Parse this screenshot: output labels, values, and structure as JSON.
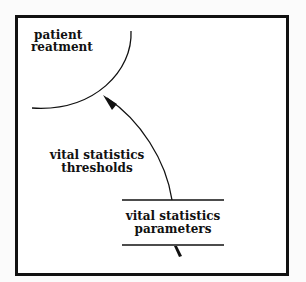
{
  "diagram": {
    "top_cut_text": "",
    "process": {
      "label_line1": "patient",
      "label_line2": "reatment"
    },
    "flow": {
      "label_line1": "vital statistics",
      "label_line2": "thresholds"
    },
    "data_store": {
      "label_line1": "vital statistics",
      "label_line2": "parameters"
    },
    "colors": {
      "stroke": "#111111",
      "background": "#ffffff",
      "page": "#fbfbfb"
    }
  }
}
